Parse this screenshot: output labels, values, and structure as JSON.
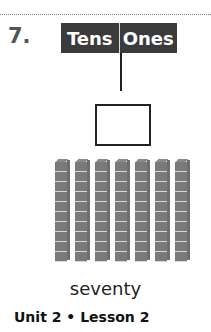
{
  "problem": {
    "number": "7.",
    "header": {
      "tens_label": "Tens",
      "ones_label": "Ones"
    },
    "answer_box": {
      "value": ""
    },
    "model": {
      "rods": 7,
      "cubes_per_rod": 10,
      "unit_color": "#7a7a7a"
    },
    "caption": "seventy"
  },
  "footer": {
    "text": "Unit 2 • Lesson 2"
  }
}
